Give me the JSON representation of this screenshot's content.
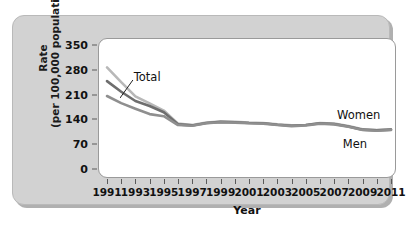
{
  "chart_data": {
    "type": "line",
    "title": "",
    "xlabel": "Year",
    "ylabel_line1": "Rate",
    "ylabel_line2": "(per 100,000 population)",
    "ylabel": "Rate (per 100,000 population)",
    "ylim": [
      0,
      350
    ],
    "yticks": [
      350,
      280,
      210,
      140,
      70,
      0
    ],
    "xlim": [
      1991,
      2011
    ],
    "xticks": [
      1991,
      1993,
      1995,
      1997,
      1999,
      2001,
      2003,
      2005,
      2007,
      2009,
      2011
    ],
    "x_minor_ticks": [
      1992,
      1994,
      1996,
      1998,
      2000,
      2002,
      2004,
      2006,
      2008,
      2010
    ],
    "grid": false,
    "legend_position": "inline-annotations",
    "x": [
      1991,
      1992,
      1993,
      1994,
      1995,
      1996,
      1997,
      1998,
      1999,
      2000,
      2001,
      2002,
      2003,
      2004,
      2005,
      2006,
      2007,
      2008,
      2009,
      2010,
      2011
    ],
    "series": [
      {
        "name": "Men",
        "color": "#b8b8b8",
        "values": [
          287,
          245,
          205,
          185,
          165,
          128,
          124,
          131,
          134,
          133,
          131,
          130,
          126,
          123,
          124,
          130,
          128,
          121,
          112,
          110,
          112
        ]
      },
      {
        "name": "Total",
        "color": "#6e6e6e",
        "values": [
          248,
          218,
          192,
          178,
          160,
          126,
          123,
          130,
          133,
          132,
          130,
          129,
          125,
          122,
          124,
          129,
          127,
          120,
          111,
          109,
          111
        ]
      },
      {
        "name": "Women",
        "color": "#8f8f8f",
        "values": [
          206,
          186,
          170,
          155,
          149,
          124,
          122,
          129,
          132,
          131,
          129,
          128,
          124,
          121,
          123,
          128,
          126,
          119,
          110,
          108,
          110
        ]
      }
    ],
    "annotations": [
      {
        "text": "Total",
        "target_series": "Total",
        "target_year": 1992
      },
      {
        "text": "Women",
        "target_series": "Women",
        "target_year": 2011
      },
      {
        "text": "Men",
        "target_series": "Men",
        "target_year": 2011
      }
    ],
    "colors": {
      "panel_background": "#d2d2d2",
      "plot_background": "#ffffff",
      "axis": "#5a5a5a",
      "text": "#111111"
    }
  }
}
